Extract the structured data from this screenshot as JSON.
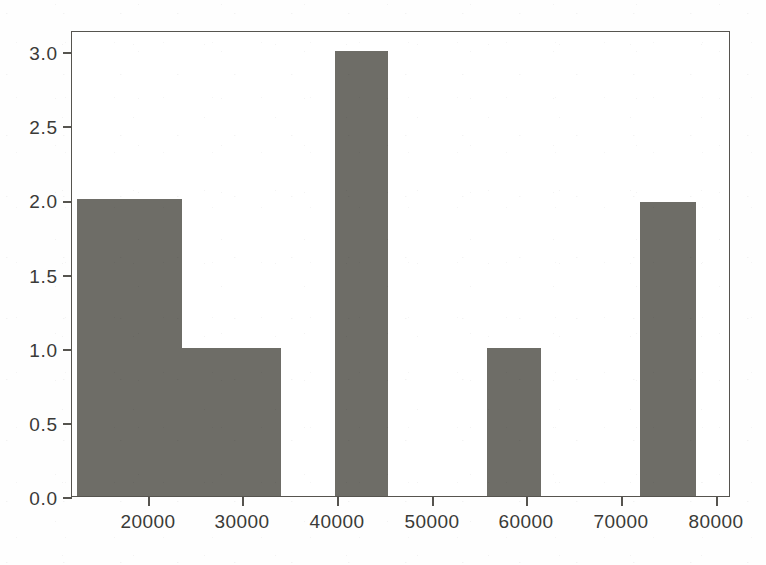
{
  "chart_data": {
    "type": "bar",
    "title": "",
    "subtitle": "",
    "xlabel": "",
    "ylabel": "",
    "grid": false,
    "legend": null,
    "xlim": [
      14400,
      82400
    ],
    "ylim": [
      0.0,
      3.14
    ],
    "x_ticks": [
      20000,
      30000,
      40000,
      50000,
      60000,
      70000,
      80000
    ],
    "x_tick_labels": [
      "20000",
      "30000",
      "40000",
      "50000",
      "60000",
      "70000",
      "80000"
    ],
    "y_ticks": [
      0.0,
      0.5,
      1.0,
      1.5,
      2.0,
      2.5,
      3.0
    ],
    "y_tick_labels": [
      "0.0",
      "0.5",
      "1.0",
      "1.5",
      "2.0",
      "2.5",
      "3.0"
    ],
    "bar_color": "#6e6d67",
    "axis_color": "#56544f",
    "background_color": "#ffffff",
    "bins": [
      {
        "x_start": 14900,
        "x_end": 25700,
        "value": 2.0
      },
      {
        "x_start": 25700,
        "x_end": 36000,
        "value": 1.0
      },
      {
        "x_start": 41500,
        "x_end": 47000,
        "value": 3.0
      },
      {
        "x_start": 57200,
        "x_end": 62800,
        "value": 1.0
      },
      {
        "x_start": 73000,
        "x_end": 78800,
        "value": 1.98
      }
    ],
    "categories": [
      "14900-25700",
      "25700-36000",
      "41500-47000",
      "57200-62800",
      "73000-78800"
    ],
    "values": [
      2.0,
      1.0,
      3.0,
      1.0,
      1.98
    ]
  }
}
